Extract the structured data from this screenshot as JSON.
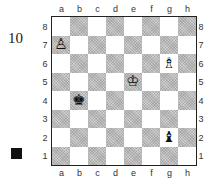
{
  "puzzle": {
    "number": "10",
    "to_move": "black",
    "to_move_marker_color": "#111111"
  },
  "board": {
    "files": [
      "a",
      "b",
      "c",
      "d",
      "e",
      "f",
      "g",
      "h"
    ],
    "ranks": [
      "8",
      "7",
      "6",
      "5",
      "4",
      "3",
      "2",
      "1"
    ],
    "light_color": "#ffffff",
    "dark_color": "#bdbdbd",
    "pieces": [
      {
        "square": "a7",
        "color": "white",
        "type": "pawn",
        "glyph": "♙"
      },
      {
        "square": "g6",
        "color": "white",
        "type": "bishop",
        "glyph": "♗"
      },
      {
        "square": "e5",
        "color": "white",
        "type": "king",
        "glyph": "♔"
      },
      {
        "square": "b4",
        "color": "black",
        "type": "king",
        "glyph": "♚"
      },
      {
        "square": "g2",
        "color": "black",
        "type": "bishop",
        "glyph": "♝"
      }
    ]
  }
}
